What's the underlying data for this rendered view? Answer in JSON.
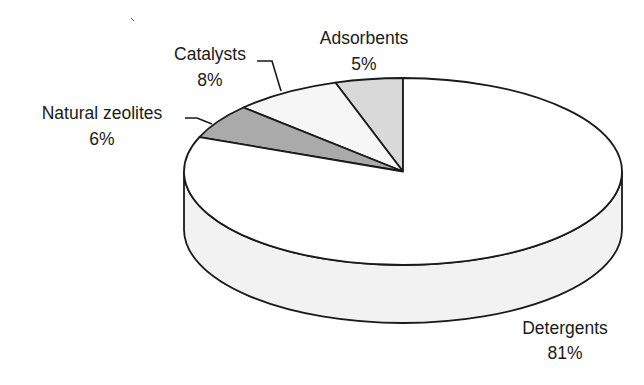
{
  "chart_data": {
    "type": "pie",
    "style": "3d-pie",
    "title": "",
    "categories": [
      "Detergents",
      "Adsorbents",
      "Catalysts",
      "Natural zeolites"
    ],
    "values": [
      81,
      5,
      8,
      6
    ],
    "unit": "%",
    "slices": [
      {
        "label": "Adsorbents",
        "value": 5,
        "display": "5%",
        "fill": "#d9d9d9"
      },
      {
        "label": "Catalysts",
        "value": 8,
        "display": "8%",
        "fill": "#f6f6f6"
      },
      {
        "label": "Natural zeolites",
        "value": 6,
        "display": "6%",
        "fill": "#aaaaaa"
      },
      {
        "label": "Detergents",
        "value": 81,
        "display": "81%",
        "fill": "#ffffff"
      }
    ],
    "start_angle": "12 o'clock, counter-clockwise",
    "legend": "none (direct labels)",
    "side_fill": "#f2f2f2"
  },
  "labels": {
    "adsorbents": {
      "name": "Adsorbents",
      "pct": "5%"
    },
    "catalysts": {
      "name": "Catalysts",
      "pct": "8%"
    },
    "natural_zeolites": {
      "name": "Natural zeolites",
      "pct": "6%"
    },
    "detergents": {
      "name": "Detergents",
      "pct": "81%"
    }
  }
}
